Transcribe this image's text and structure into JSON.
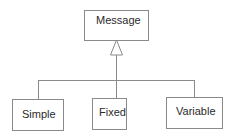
{
  "diagram": {
    "type": "uml-class-inheritance",
    "parent": {
      "label": "Message"
    },
    "children": [
      {
        "label": "Simple"
      },
      {
        "label": "Fixed"
      },
      {
        "label": "Variable"
      }
    ],
    "relationship": "generalization",
    "colors": {
      "line": "#8a8a8a",
      "text": "#2a2a2a",
      "background": "#ffffff"
    }
  }
}
